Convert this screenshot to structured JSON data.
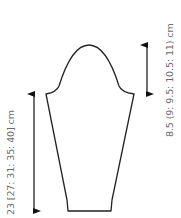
{
  "diagram": {
    "type": "knitting-schematic",
    "piece": "sleeve",
    "stroke_color": "#222222",
    "label_color": "#6b6b6b",
    "measurements": {
      "sleeve_length": {
        "label": "23 [27: 31: 35: 40] cm",
        "values": [
          23,
          27,
          31,
          35,
          40
        ],
        "unit": "cm"
      },
      "cap_height": {
        "label": "8.5 (9: 9.5: 10.5: 11) cm",
        "values": [
          8.5,
          9,
          9.5,
          10.5,
          11
        ],
        "unit": "cm"
      }
    }
  }
}
